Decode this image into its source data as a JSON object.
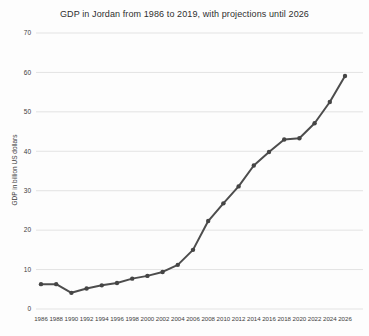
{
  "chart_data": {
    "type": "line",
    "title": "GDP in Jordan from 1986 to 2019, with projections until 2026",
    "xlabel": "",
    "ylabel": "GDP in billion US dollars",
    "ylim": [
      0,
      70
    ],
    "ytick_step": 10,
    "grid": true,
    "legend": "none",
    "categories": [
      "1986",
      "1988",
      "1990",
      "1992",
      "1994",
      "1996",
      "1998",
      "2000",
      "2002",
      "2004",
      "2006",
      "2008",
      "2010",
      "2012",
      "2014",
      "2016",
      "2018",
      "2020",
      "2022",
      "2024",
      "2026"
    ],
    "values": [
      6.3,
      6.3,
      4.1,
      5.2,
      6.0,
      6.6,
      7.7,
      8.4,
      9.4,
      11.2,
      15.0,
      22.3,
      26.8,
      31.1,
      36.4,
      39.8,
      43.0,
      43.3,
      47.1,
      52.5,
      59.1
    ],
    "series_name": "GDP in billion US dollars",
    "colors": {
      "line": "#4d4d4d",
      "marker": "#454545",
      "gridline": "#e3e3e3",
      "text": "#3c3c3c",
      "background": "#fdfdfd"
    }
  }
}
